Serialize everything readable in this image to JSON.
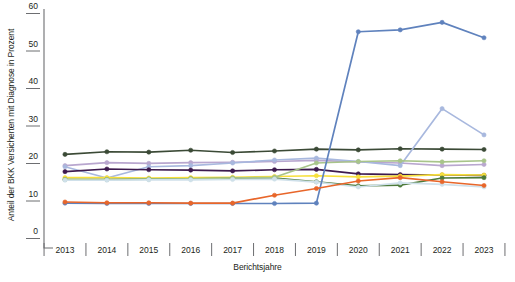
{
  "chart_data": {
    "type": "line",
    "title": "",
    "xlabel": "Berichtsjahre",
    "ylabel": "Anteil der BKK Versicherten mit Diagnose in Prozent",
    "x": [
      2013,
      2014,
      2015,
      2016,
      2017,
      2018,
      2019,
      2020,
      2021,
      2022,
      2023
    ],
    "categories": [
      "2013",
      "2014",
      "2015",
      "2016",
      "2017",
      "2018",
      "2019",
      "2020",
      "2021",
      "2022",
      "2023"
    ],
    "xlim": [
      2012.5,
      2023.5
    ],
    "ylim": [
      0,
      60
    ],
    "yticks": [
      0,
      10,
      20,
      30,
      40,
      50,
      60
    ],
    "ytick_labels": [
      "0",
      "10",
      "20",
      "30",
      "40",
      "50",
      "60"
    ],
    "grid": false,
    "legend": "none",
    "markers": "circle",
    "series": [
      {
        "name": "series-dark-green",
        "color": "#3b4a36",
        "values": [
          22.3,
          23.0,
          22.9,
          23.4,
          22.8,
          23.2,
          23.7,
          23.5,
          23.8,
          23.7,
          23.6
        ]
      },
      {
        "name": "series-light-purple",
        "color": "#b9a7cf",
        "values": [
          19.3,
          20.1,
          19.9,
          20.1,
          20.2,
          20.4,
          20.7,
          20.3,
          20.0,
          19.3,
          19.6
        ]
      },
      {
        "name": "series-light-blue",
        "color": "#a8b8de",
        "values": [
          19.0,
          16.0,
          19.0,
          19.3,
          20.0,
          20.8,
          21.3,
          20.4,
          19.3,
          34.5,
          27.5
        ]
      },
      {
        "name": "series-dark-purple",
        "color": "#3d1a4e",
        "values": [
          17.7,
          18.4,
          18.2,
          18.1,
          17.9,
          18.2,
          18.3,
          17.1,
          16.9,
          16.8,
          16.7
        ]
      },
      {
        "name": "series-yellow",
        "color": "#f7e03c",
        "values": [
          16.1,
          16.1,
          16.0,
          16.1,
          16.2,
          16.4,
          16.6,
          16.3,
          16.5,
          16.9,
          16.8
        ]
      },
      {
        "name": "series-green",
        "color": "#4d7a3a",
        "values": [
          15.6,
          15.6,
          15.7,
          15.8,
          15.9,
          16.0,
          15.0,
          13.9,
          14.1,
          16.0,
          16.1
        ]
      },
      {
        "name": "series-sage-green",
        "color": "#a8c48a",
        "values": [
          15.6,
          15.6,
          15.7,
          15.8,
          16.0,
          16.2,
          20.0,
          20.4,
          20.6,
          20.3,
          20.6
        ]
      },
      {
        "name": "series-pale-blue",
        "color": "#cfe0ea",
        "values": [
          15.4,
          15.4,
          15.5,
          15.5,
          15.6,
          15.7,
          14.9,
          13.6,
          14.7,
          14.3,
          13.6
        ]
      },
      {
        "name": "series-steel-blue",
        "color": "#5f82bd",
        "values": [
          9.3,
          9.2,
          9.2,
          9.2,
          9.2,
          9.2,
          9.3,
          55.0,
          55.5,
          57.5,
          53.4
        ]
      },
      {
        "name": "series-orange",
        "color": "#e8662a",
        "values": [
          9.6,
          9.4,
          9.4,
          9.3,
          9.3,
          11.4,
          13.2,
          15.2,
          16.1,
          15.0,
          14.0
        ]
      }
    ]
  }
}
